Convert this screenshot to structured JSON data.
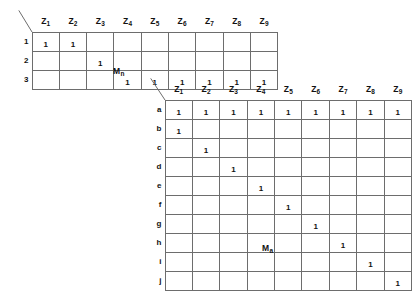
{
  "figure": {
    "tables": [
      {
        "id": "mn",
        "caption_main": "M",
        "caption_sub": "n",
        "corner_icon": "diagonal-slash-icon",
        "column_headers": [
          {
            "main": "Z",
            "sub": "1"
          },
          {
            "main": "Z",
            "sub": "2"
          },
          {
            "main": "Z",
            "sub": "3"
          },
          {
            "main": "Z",
            "sub": "4"
          },
          {
            "main": "Z",
            "sub": "5"
          },
          {
            "main": "Z",
            "sub": "6"
          },
          {
            "main": "Z",
            "sub": "7"
          },
          {
            "main": "Z",
            "sub": "8"
          },
          {
            "main": "Z",
            "sub": "9"
          }
        ],
        "row_headers": [
          "1",
          "2",
          "3"
        ],
        "rows": [
          [
            "1",
            "1",
            "",
            "",
            "",
            "",
            "",
            "",
            ""
          ],
          [
            "",
            "",
            "1",
            "",
            "",
            "",
            "",
            "",
            ""
          ],
          [
            "",
            "",
            "",
            "1",
            "1",
            "1",
            "1",
            "1",
            "1"
          ]
        ]
      },
      {
        "id": "ma",
        "caption_main": "M",
        "caption_sub": "a",
        "corner_icon": "diagonal-slash-icon",
        "column_headers": [
          {
            "main": "Z",
            "sub": "1"
          },
          {
            "main": "Z",
            "sub": "2"
          },
          {
            "main": "Z",
            "sub": "3"
          },
          {
            "main": "Z",
            "sub": "4"
          },
          {
            "main": "Z",
            "sub": "5"
          },
          {
            "main": "Z",
            "sub": "6"
          },
          {
            "main": "Z",
            "sub": "7"
          },
          {
            "main": "Z",
            "sub": "8"
          },
          {
            "main": "Z",
            "sub": "9"
          }
        ],
        "row_headers": [
          "a",
          "b",
          "c",
          "d",
          "e",
          "f",
          "g",
          "h",
          "i",
          "j"
        ],
        "rows": [
          [
            "1",
            "1",
            "1",
            "1",
            "1",
            "1",
            "1",
            "1",
            "1"
          ],
          [
            "1",
            "",
            "",
            "",
            "",
            "",
            "",
            "",
            ""
          ],
          [
            "",
            "1",
            "",
            "",
            "",
            "",
            "",
            "",
            ""
          ],
          [
            "",
            "",
            "1",
            "",
            "",
            "",
            "",
            "",
            ""
          ],
          [
            "",
            "",
            "",
            "1",
            "",
            "",
            "",
            "",
            ""
          ],
          [
            "",
            "",
            "",
            "",
            "1",
            "",
            "",
            "",
            ""
          ],
          [
            "",
            "",
            "",
            "",
            "",
            "1",
            "",
            "",
            ""
          ],
          [
            "",
            "",
            "",
            "",
            "",
            "",
            "1",
            "",
            ""
          ],
          [
            "",
            "",
            "",
            "",
            "",
            "",
            "",
            "1",
            ""
          ],
          [
            "",
            "",
            "",
            "",
            "",
            "",
            "",
            "",
            "1"
          ]
        ]
      }
    ],
    "colors": {
      "grid_line": "#6d6d6d",
      "text": "#111111",
      "background": "#ffffff"
    }
  }
}
